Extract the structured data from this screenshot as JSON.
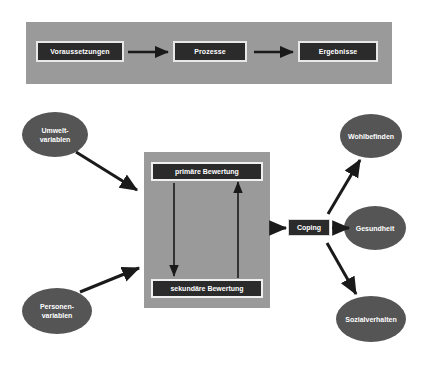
{
  "diagram": {
    "colors": {
      "band_background": "#9a9a9a",
      "panel_background": "#9a9a9a",
      "box_fill": "#2b2b2b",
      "box_border": "#e8e8e8",
      "ellipse_fill": "#555555",
      "text": "#ffffff",
      "arrow": "#1a1a1a",
      "page_background": "#ffffff"
    },
    "top_band": {
      "boxes": [
        {
          "label": "Voraussetzungen"
        },
        {
          "label": "Prozesse"
        },
        {
          "label": "Ergebnisse"
        }
      ],
      "arrows": [
        {
          "from": "Voraussetzungen",
          "to": "Prozesse"
        },
        {
          "from": "Prozesse",
          "to": "Ergebnisse"
        }
      ]
    },
    "inputs": [
      {
        "id": "umwelt",
        "lines": [
          "Umwelt-",
          "variablen"
        ]
      },
      {
        "id": "personen",
        "lines": [
          "Personen-",
          "variablen"
        ]
      }
    ],
    "panel": {
      "primary": {
        "label": "primäre Bewertung"
      },
      "secondary": {
        "label": "sekundäre Bewertung"
      },
      "internal_arrows": [
        {
          "direction": "down",
          "from": "primäre Bewertung",
          "to": "sekundäre Bewertung"
        },
        {
          "direction": "up",
          "from": "sekundäre Bewertung",
          "to": "primäre Bewertung"
        }
      ]
    },
    "coping": {
      "label": "Coping"
    },
    "outcomes": [
      {
        "id": "wohlbefinden",
        "lines": [
          "Wohlbefinden"
        ]
      },
      {
        "id": "gesundheit",
        "lines": [
          "Gesundheit"
        ]
      },
      {
        "id": "sozialverhalten",
        "lines": [
          "Sozialverhalten"
        ]
      }
    ],
    "connections": [
      {
        "from": "Umwelt-variablen",
        "to": "Bewertungspanel"
      },
      {
        "from": "Personen-variablen",
        "to": "Bewertungspanel"
      },
      {
        "from": "Bewertungspanel",
        "to": "Coping"
      },
      {
        "from": "Coping",
        "to": "Wohlbefinden"
      },
      {
        "from": "Coping",
        "to": "Gesundheit"
      },
      {
        "from": "Coping",
        "to": "Sozialverhalten"
      }
    ]
  }
}
